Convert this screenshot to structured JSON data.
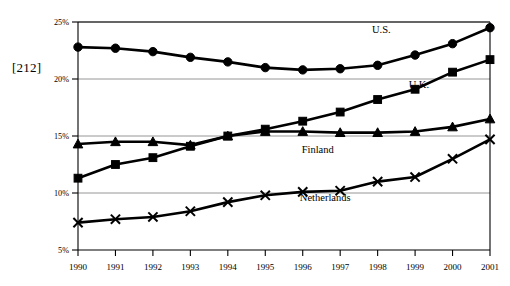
{
  "page_marker": "[212]",
  "chart_data": {
    "type": "line",
    "title": "",
    "subtitle": "",
    "xlabel": "",
    "ylabel": "",
    "categories": [
      "1990",
      "1991",
      "1992",
      "1993",
      "1994",
      "1995",
      "1996",
      "1997",
      "1998",
      "1999",
      "2000",
      "2001"
    ],
    "x": [
      1990,
      1991,
      1992,
      1993,
      1994,
      1995,
      1996,
      1997,
      1998,
      1999,
      2000,
      2001
    ],
    "ylim": [
      5,
      25
    ],
    "xlim": [
      1990,
      2001
    ],
    "yticks": [
      5,
      10,
      15,
      20,
      25
    ],
    "ytick_labels": [
      "5%",
      "10%",
      "15%",
      "20%",
      "25%"
    ],
    "xtick_labels": [
      "1990",
      "1991",
      "1992",
      "1993",
      "1994",
      "1995",
      "1996",
      "1997",
      "1998",
      "1999",
      "2000",
      "2001"
    ],
    "grid": true,
    "grid_axis": "y",
    "legend_position": "inline-annotations",
    "value_suffix": "%",
    "series": [
      {
        "name": "U.S.",
        "marker": "circle",
        "label_x": 1998.1,
        "label_y": 24.0,
        "values": [
          22.8,
          22.7,
          22.4,
          21.9,
          21.5,
          21.0,
          20.8,
          20.9,
          21.2,
          22.1,
          23.1,
          24.5
        ]
      },
      {
        "name": "U.K.",
        "marker": "square",
        "label_x": 1999.1,
        "label_y": 19.2,
        "values": [
          11.3,
          12.5,
          13.1,
          14.1,
          15.0,
          15.6,
          16.3,
          17.1,
          18.2,
          19.1,
          20.6,
          21.7
        ]
      },
      {
        "name": "Finland",
        "marker": "triangle",
        "label_x": 1996.4,
        "label_y": 13.5,
        "values": [
          14.3,
          14.5,
          14.5,
          14.2,
          15.0,
          15.4,
          15.4,
          15.3,
          15.3,
          15.4,
          15.8,
          16.5
        ]
      },
      {
        "name": "Netherlands",
        "marker": "cross",
        "label_x": 1996.6,
        "label_y": 9.3,
        "values": [
          7.4,
          7.7,
          7.9,
          8.4,
          9.2,
          9.8,
          10.1,
          10.2,
          11.0,
          11.4,
          13.0,
          14.7
        ]
      }
    ]
  }
}
